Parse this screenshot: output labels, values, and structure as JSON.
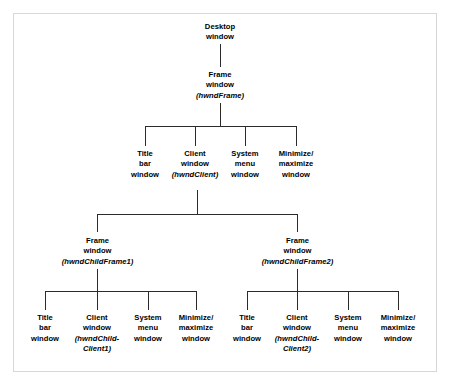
{
  "diagram": {
    "border_color": "#d8d8d8",
    "line_color": "#2b2b2b",
    "text_color": "#000000",
    "background": "#ffffff",
    "nodes": {
      "desktop": {
        "line1": "Desktop",
        "line2": "window"
      },
      "frame": {
        "line1": "Frame",
        "line2": "window",
        "handle": "(hwndFrame)"
      },
      "title_bar_1": {
        "line1": "Title",
        "line2": "bar",
        "line3": "window"
      },
      "client_1": {
        "line1": "Client",
        "line2": "window",
        "handle": "(hwndClient)"
      },
      "system_menu_1": {
        "line1": "System",
        "line2": "menu",
        "line3": "window"
      },
      "min_max_1": {
        "line1": "Minimize/",
        "line2": "maximize",
        "line3": "window"
      },
      "child_frame_1": {
        "line1": "Frame",
        "line2": "window",
        "handle": "(hwndChildFrame1)"
      },
      "child_frame_2": {
        "line1": "Frame",
        "line2": "window",
        "handle": "(hwndChildFrame2)"
      },
      "title_bar_2": {
        "line1": "Title",
        "line2": "bar",
        "line3": "window"
      },
      "client_2": {
        "line1": "Client",
        "line2": "window",
        "handle": "(hwndChild-Client1)"
      },
      "system_menu_2": {
        "line1": "System",
        "line2": "menu",
        "line3": "window"
      },
      "min_max_2": {
        "line1": "Minimize/",
        "line2": "maximize",
        "line3": "window"
      },
      "title_bar_3": {
        "line1": "Title",
        "line2": "bar",
        "line3": "window"
      },
      "client_3": {
        "line1": "Client",
        "line2": "window",
        "handle": "(hwndChild-Client2)"
      },
      "system_menu_3": {
        "line1": "System",
        "line2": "menu",
        "line3": "window"
      },
      "min_max_3": {
        "line1": "Minimize/",
        "line2": "maximize",
        "line3": "window"
      }
    }
  }
}
